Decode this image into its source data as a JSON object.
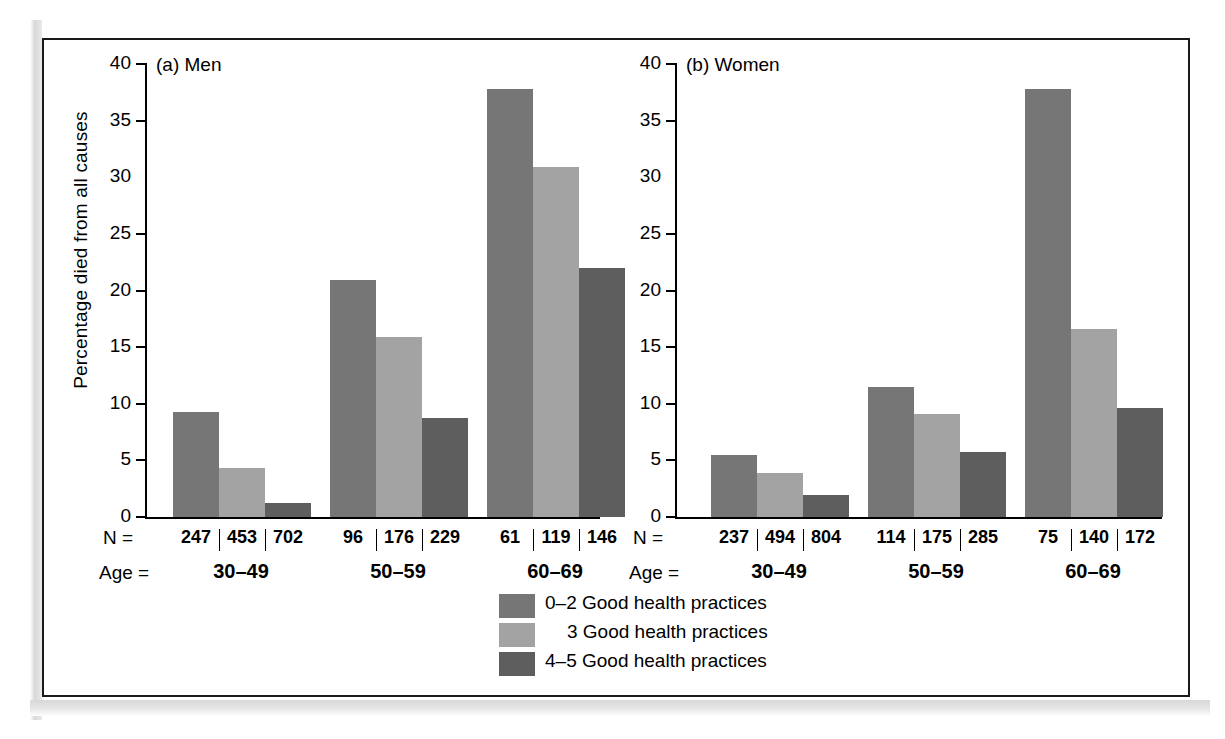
{
  "figure": {
    "y_axis_title": "Percentage died from all causes",
    "n_label": "N =",
    "age_label": "Age ="
  },
  "panels": [
    {
      "id": "a",
      "title": "(a) Men",
      "groups": [
        {
          "age": "30–49",
          "n": [
            "247",
            "453",
            "702"
          ],
          "values": [
            9.3,
            4.3,
            1.2
          ]
        },
        {
          "age": "50–59",
          "n": [
            "96",
            "176",
            "229"
          ],
          "values": [
            20.9,
            15.9,
            8.7
          ]
        },
        {
          "age": "60–69",
          "n": [
            "61",
            "119",
            "146"
          ],
          "values": [
            37.8,
            30.9,
            22.0
          ]
        }
      ]
    },
    {
      "id": "b",
      "title": "(b) Women",
      "groups": [
        {
          "age": "30–49",
          "n": [
            "237",
            "494",
            "804"
          ],
          "values": [
            5.5,
            3.9,
            1.9
          ]
        },
        {
          "age": "50–59",
          "n": [
            "114",
            "175",
            "285"
          ],
          "values": [
            11.5,
            9.1,
            5.7
          ]
        },
        {
          "age": "60–69",
          "n": [
            "75",
            "140",
            "172"
          ],
          "values": [
            37.8,
            16.6,
            9.6
          ]
        }
      ]
    }
  ],
  "y_ticks": [
    "40",
    "35",
    "30",
    "25",
    "20",
    "15",
    "10",
    "5",
    "0"
  ],
  "legend": [
    {
      "label": "0–2 Good health practices",
      "color": "#767676"
    },
    {
      "label": "3 Good health practices",
      "color": "#a3a3a3"
    },
    {
      "label": "4–5 Good health practices",
      "color": "#5e5e5e"
    }
  ],
  "colors": {
    "series_0_2": "#767676",
    "series_3": "#a3a3a3",
    "series_4_5": "#5e5e5e",
    "axis": "#000000",
    "frame": "#1a1a1a",
    "background": "#ffffff"
  },
  "chart_data": {
    "type": "bar",
    "xlabel": "Age",
    "ylabel": "Percentage died from all causes",
    "ylim": [
      0,
      40
    ],
    "yticks": [
      0,
      5,
      10,
      15,
      20,
      25,
      30,
      35,
      40
    ],
    "grid": false,
    "legend_position": "bottom-center",
    "panels": [
      {
        "name": "(a) Men",
        "categories": [
          "30–49",
          "50–59",
          "60–69"
        ],
        "series": [
          {
            "name": "0–2 Good health practices",
            "values": [
              9.3,
              20.9,
              37.8
            ],
            "n": [
              247,
              96,
              61
            ]
          },
          {
            "name": "3 Good health practices",
            "values": [
              4.3,
              15.9,
              30.9
            ],
            "n": [
              453,
              176,
              119
            ]
          },
          {
            "name": "4–5 Good health practices",
            "values": [
              1.2,
              8.7,
              22.0
            ],
            "n": [
              702,
              229,
              146
            ]
          }
        ]
      },
      {
        "name": "(b) Women",
        "categories": [
          "30–49",
          "50–59",
          "60–69"
        ],
        "series": [
          {
            "name": "0–2 Good health practices",
            "values": [
              5.5,
              11.5,
              37.8
            ],
            "n": [
              237,
              114,
              75
            ]
          },
          {
            "name": "3 Good health practices",
            "values": [
              3.9,
              9.1,
              16.6
            ],
            "n": [
              494,
              175,
              140
            ]
          },
          {
            "name": "4–5 Good health practices",
            "values": [
              1.9,
              5.7,
              9.6
            ],
            "n": [
              804,
              285,
              172
            ]
          }
        ]
      }
    ]
  }
}
